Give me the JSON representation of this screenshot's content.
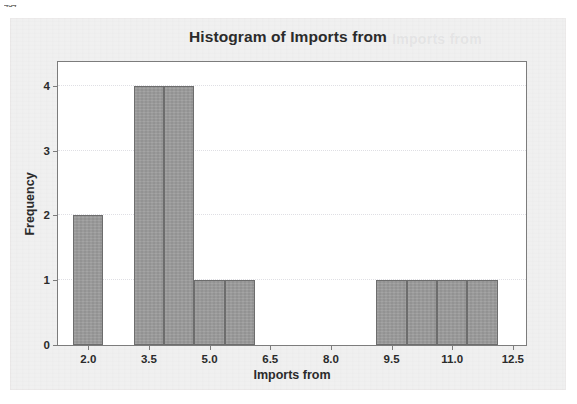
{
  "page_number": "434",
  "figure": {
    "title": "Histogram of Imports from",
    "title_ghost": "Imports from"
  },
  "chart_data": {
    "type": "bar",
    "title": "Histogram of Imports from",
    "xlabel": "Imports from",
    "ylabel": "Frequency",
    "xlim": [
      1.25,
      12.875
    ],
    "ylim": [
      0,
      4.4
    ],
    "grid": true,
    "legend": "none",
    "bin_width": 0.75,
    "x_ticks": [
      "2.0",
      "3.5",
      "5.0",
      "6.5",
      "8.0",
      "9.5",
      "11.0",
      "12.5"
    ],
    "x_tick_values": [
      2.0,
      3.5,
      5.0,
      6.5,
      8.0,
      9.5,
      11.0,
      12.5
    ],
    "y_ticks": [
      "0",
      "1",
      "2",
      "3",
      "4"
    ],
    "y_tick_values": [
      0,
      1,
      2,
      3,
      4
    ],
    "bars": [
      {
        "label": "1.625-2.375",
        "x0": 1.625,
        "x1": 2.375,
        "value": 2
      },
      {
        "label": "3.125-3.875",
        "x0": 3.125,
        "x1": 3.875,
        "value": 4
      },
      {
        "label": "3.875-4.625",
        "x0": 3.875,
        "x1": 4.625,
        "value": 4
      },
      {
        "label": "4.625-5.375",
        "x0": 4.625,
        "x1": 5.375,
        "value": 1
      },
      {
        "label": "5.375-6.125",
        "x0": 5.375,
        "x1": 6.125,
        "value": 1
      },
      {
        "label": "9.125-9.875",
        "x0": 9.125,
        "x1": 9.875,
        "value": 1
      },
      {
        "label": "9.875-10.625",
        "x0": 9.875,
        "x1": 10.625,
        "value": 1
      },
      {
        "label": "10.625-11.375",
        "x0": 10.625,
        "x1": 11.375,
        "value": 1
      },
      {
        "label": "11.375-12.125",
        "x0": 11.375,
        "x1": 12.125,
        "value": 1
      }
    ],
    "colors": {
      "bar_fill": "#9b9b9b",
      "bar_outline": "#6d6d6d",
      "plot_background": "#ffffff",
      "card_background": "#f0f0f0",
      "axis": "#7c7c7c",
      "text": "#2b2b2b",
      "gridline": "#9696a5"
    }
  }
}
